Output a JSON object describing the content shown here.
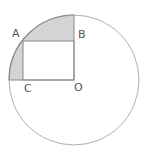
{
  "diagram": {
    "labels": {
      "A": "A",
      "B": "B",
      "C": "C",
      "O": "O"
    },
    "colors": {
      "stroke": "#9a9a9a",
      "shade": "#d4d4d4",
      "label": "#555555"
    }
  }
}
